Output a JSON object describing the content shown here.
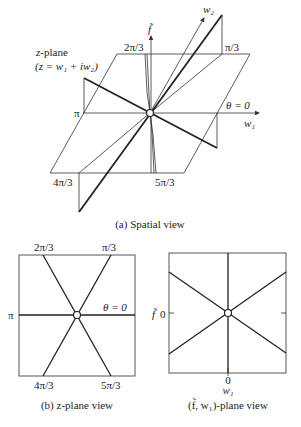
{
  "figure": {
    "panel_a": {
      "caption": "(a) Spatial view",
      "plane_label": "z-plane",
      "plane_equation": "(z = w₁ + iw₂)",
      "axis_f": "f̃",
      "axis_w1": "w₁",
      "axis_w2": "w₂",
      "angle_labels": {
        "theta0": "θ = 0",
        "pi_over_3": "π/3",
        "two_pi_over_3": "2π/3",
        "pi": "π",
        "four_pi_over_3": "4π/3",
        "five_pi_over_3": "5π/3"
      }
    },
    "panel_b": {
      "caption": "(b) z-plane view",
      "angle_labels": {
        "theta0": "θ = 0",
        "pi_over_3": "π/3",
        "two_pi_over_3": "2π/3",
        "pi": "π",
        "four_pi_over_3": "4π/3",
        "five_pi_over_3": "5π/3"
      }
    },
    "panel_c": {
      "caption": "(f̃, w₁)-plane view",
      "y_axis_label": "f̃",
      "y_tick": "0",
      "x_tick": "0",
      "x_axis_label": "w₁"
    }
  },
  "colors": {
    "line": "#222222",
    "background": "#ffffff"
  }
}
